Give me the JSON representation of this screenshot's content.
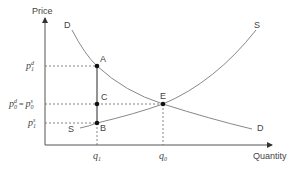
{
  "diagram": {
    "type": "supply-demand",
    "axes": {
      "y_label": "Price",
      "x_label": "Quantity"
    },
    "curves": {
      "demand": {
        "label_top": "D",
        "label_bottom": "D"
      },
      "supply": {
        "label_top": "S",
        "label_bottom": "S"
      }
    },
    "points": {
      "A": "A",
      "B": "B",
      "C": "C",
      "E": "E"
    },
    "y_ticks": {
      "p1d": {
        "base": "p",
        "sub": "1",
        "sup": "d"
      },
      "p0": {
        "left_base": "p",
        "left_sub": "0",
        "left_sup": "d",
        "eq": " = ",
        "right_base": "p",
        "right_sub": "0",
        "right_sup": "s"
      },
      "p1s": {
        "base": "p",
        "sub": "1",
        "sup": "s"
      }
    },
    "x_ticks": {
      "q1": {
        "base": "q",
        "sub": "1"
      },
      "q0": {
        "base": "q",
        "sub": "0"
      }
    },
    "colors": {
      "axis": "#555555",
      "curve": "#777777",
      "dashed": "#666666",
      "point": "#111111",
      "text": "#444444"
    }
  }
}
